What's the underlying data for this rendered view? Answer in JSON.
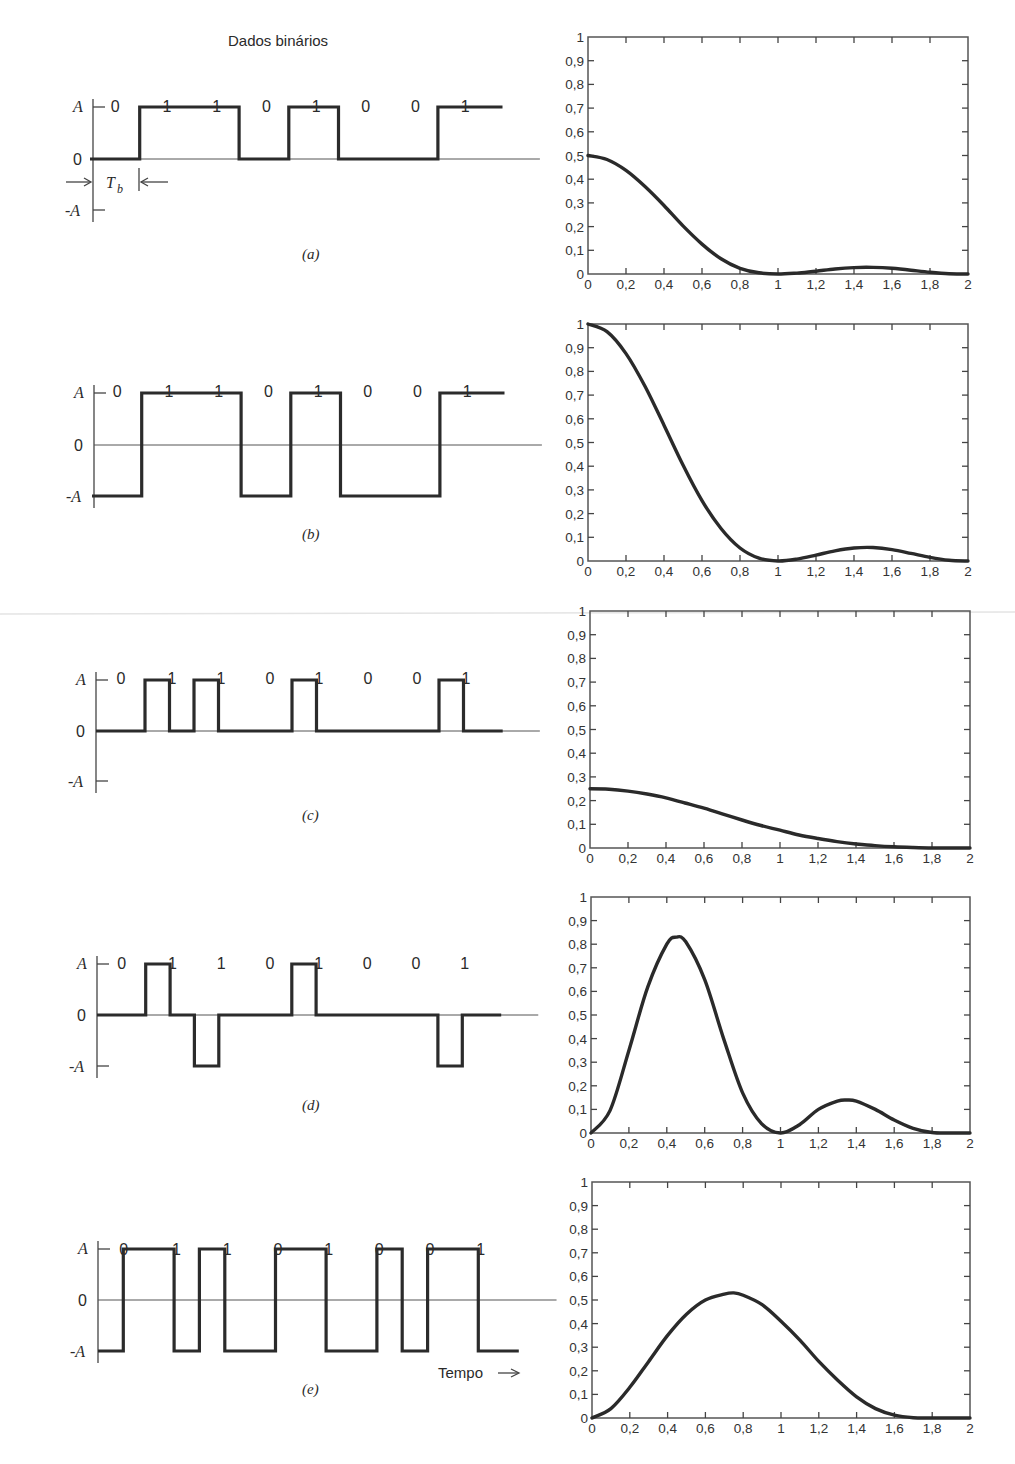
{
  "figure": {
    "title": "Dados binários",
    "time_label": "Tempo",
    "bits": [
      "0",
      "1",
      "1",
      "0",
      "1",
      "0",
      "0",
      "1"
    ],
    "level_labels": {
      "high": "A",
      "zero": "0",
      "low": "-A"
    },
    "bit_period_label": "T",
    "bit_period_subscript": "b"
  },
  "chart_data": [
    {
      "type": "line",
      "panel": "(a)",
      "waveform": {
        "name": "Unipolar NRZ",
        "bits": [
          0,
          1,
          1,
          0,
          1,
          0,
          0,
          1
        ],
        "levels": [
          0,
          1,
          1,
          0,
          1,
          0,
          0,
          1
        ],
        "shape": "nrz"
      },
      "title": "",
      "xlabel": "",
      "ylabel": "",
      "xlim": [
        0,
        2
      ],
      "ylim": [
        0,
        1
      ],
      "xticks": [
        "0",
        "0,2",
        "0,4",
        "0,6",
        "0,8",
        "1",
        "1,2",
        "1,4",
        "1,6",
        "1,8",
        "2"
      ],
      "yticks": [
        "0",
        "0,1",
        "0,2",
        "0,3",
        "0,4",
        "0,5",
        "0,6",
        "0,7",
        "0,8",
        "0,9",
        "1"
      ],
      "x": [
        0,
        0.1,
        0.2,
        0.3,
        0.4,
        0.5,
        0.6,
        0.7,
        0.8,
        0.9,
        1.0,
        1.1,
        1.2,
        1.3,
        1.4,
        1.5,
        1.6,
        1.7,
        1.8,
        1.9,
        2.0
      ],
      "values": [
        0.5,
        0.483,
        0.437,
        0.369,
        0.289,
        0.203,
        0.126,
        0.064,
        0.024,
        0.005,
        0.0,
        0.004,
        0.012,
        0.021,
        0.027,
        0.028,
        0.024,
        0.016,
        0.007,
        0.001,
        0.0
      ]
    },
    {
      "type": "line",
      "panel": "(b)",
      "waveform": {
        "name": "Polar NRZ",
        "bits": [
          0,
          1,
          1,
          0,
          1,
          0,
          0,
          1
        ],
        "levels": [
          -1,
          1,
          1,
          -1,
          1,
          -1,
          -1,
          1
        ],
        "shape": "nrz"
      },
      "title": "",
      "xlabel": "",
      "ylabel": "",
      "xlim": [
        0,
        2
      ],
      "ylim": [
        0,
        1
      ],
      "xticks": [
        "0",
        "0,2",
        "0,4",
        "0,6",
        "0,8",
        "1",
        "1,2",
        "1,4",
        "1,6",
        "1,8",
        "2"
      ],
      "yticks": [
        "0",
        "0,1",
        "0,2",
        "0,3",
        "0,4",
        "0,5",
        "0,6",
        "0,7",
        "0,8",
        "0,9",
        "1"
      ],
      "x": [
        0,
        0.1,
        0.2,
        0.3,
        0.4,
        0.5,
        0.6,
        0.7,
        0.8,
        0.9,
        1.0,
        1.1,
        1.2,
        1.3,
        1.4,
        1.5,
        1.6,
        1.7,
        1.8,
        1.9,
        2.0
      ],
      "values": [
        1.0,
        0.968,
        0.875,
        0.737,
        0.573,
        0.405,
        0.255,
        0.137,
        0.055,
        0.012,
        0.0,
        0.008,
        0.025,
        0.043,
        0.055,
        0.057,
        0.048,
        0.032,
        0.015,
        0.003,
        0.0
      ]
    },
    {
      "type": "line",
      "panel": "(c)",
      "waveform": {
        "name": "Unipolar RZ",
        "bits": [
          0,
          1,
          1,
          0,
          1,
          0,
          0,
          1
        ],
        "levels": [
          0,
          1,
          1,
          0,
          1,
          0,
          0,
          1
        ],
        "shape": "rz"
      },
      "title": "",
      "xlabel": "",
      "ylabel": "",
      "xlim": [
        0,
        2
      ],
      "ylim": [
        0,
        1
      ],
      "xticks": [
        "0",
        "0,2",
        "0,4",
        "0,6",
        "0,8",
        "1",
        "1,2",
        "1,4",
        "1,6",
        "1,8",
        "2"
      ],
      "yticks": [
        "0",
        "0,1",
        "0,2",
        "0,3",
        "0,4",
        "0,5",
        "0,6",
        "0,7",
        "0,8",
        "0,9",
        "1"
      ],
      "x": [
        0,
        0.1,
        0.2,
        0.3,
        0.4,
        0.5,
        0.6,
        0.7,
        0.8,
        0.9,
        1.0,
        1.1,
        1.2,
        1.3,
        1.4,
        1.5,
        1.6,
        1.7,
        1.8,
        1.9,
        2.0
      ],
      "values": [
        0.25,
        0.248,
        0.24,
        0.228,
        0.212,
        0.19,
        0.168,
        0.143,
        0.118,
        0.095,
        0.075,
        0.055,
        0.04,
        0.027,
        0.017,
        0.01,
        0.005,
        0.002,
        0.0,
        0.0,
        0.0
      ]
    },
    {
      "type": "line",
      "panel": "(d)",
      "waveform": {
        "name": "Bipolar RZ (AMI)",
        "bits": [
          0,
          1,
          1,
          0,
          1,
          0,
          0,
          1
        ],
        "levels": [
          0,
          1,
          -1,
          0,
          1,
          0,
          0,
          -1
        ],
        "shape": "rz"
      },
      "title": "",
      "xlabel": "",
      "ylabel": "",
      "xlim": [
        0,
        2
      ],
      "ylim": [
        0,
        1
      ],
      "xticks": [
        "0",
        "0,2",
        "0,4",
        "0,6",
        "0,8",
        "1",
        "1,2",
        "1,4",
        "1,6",
        "1,8",
        "2"
      ],
      "yticks": [
        "0",
        "0,1",
        "0,2",
        "0,3",
        "0,4",
        "0,5",
        "0,6",
        "0,7",
        "0,8",
        "0,9",
        "1"
      ],
      "x": [
        0,
        0.1,
        0.2,
        0.3,
        0.4,
        0.45,
        0.5,
        0.6,
        0.7,
        0.8,
        0.9,
        1.0,
        1.1,
        1.2,
        1.3,
        1.35,
        1.4,
        1.5,
        1.6,
        1.7,
        1.8,
        1.9,
        2.0
      ],
      "values": [
        0.0,
        0.095,
        0.35,
        0.62,
        0.8,
        0.83,
        0.81,
        0.65,
        0.4,
        0.17,
        0.04,
        0.0,
        0.035,
        0.1,
        0.135,
        0.14,
        0.135,
        0.1,
        0.055,
        0.02,
        0.002,
        0.0,
        0.0
      ]
    },
    {
      "type": "line",
      "panel": "(e)",
      "waveform": {
        "name": "Manchester",
        "bits": [
          0,
          1,
          1,
          0,
          1,
          0,
          0,
          1
        ],
        "shape": "manchester"
      },
      "title": "",
      "xlabel": "",
      "ylabel": "",
      "xlim": [
        0,
        2
      ],
      "ylim": [
        0,
        1
      ],
      "xticks": [
        "0",
        "0,2",
        "0,4",
        "0,6",
        "0,8",
        "1",
        "1,2",
        "1,4",
        "1,6",
        "1,8",
        "2"
      ],
      "yticks": [
        "0",
        "0,1",
        "0,2",
        "0,3",
        "0,4",
        "0,5",
        "0,6",
        "0,7",
        "0,8",
        "0,9",
        "1"
      ],
      "x": [
        0,
        0.1,
        0.2,
        0.3,
        0.4,
        0.5,
        0.6,
        0.7,
        0.75,
        0.8,
        0.9,
        1.0,
        1.1,
        1.2,
        1.3,
        1.4,
        1.5,
        1.6,
        1.7,
        1.8,
        1.9,
        2.0
      ],
      "values": [
        0.0,
        0.04,
        0.13,
        0.24,
        0.35,
        0.44,
        0.5,
        0.525,
        0.53,
        0.52,
        0.48,
        0.41,
        0.33,
        0.24,
        0.16,
        0.09,
        0.04,
        0.012,
        0.001,
        0.0,
        0.0,
        0.0
      ]
    }
  ],
  "panels": [
    {
      "caption": "(a)"
    },
    {
      "caption": "(b)"
    },
    {
      "caption": "(c)"
    },
    {
      "caption": "(d)"
    },
    {
      "caption": "(e)"
    }
  ]
}
